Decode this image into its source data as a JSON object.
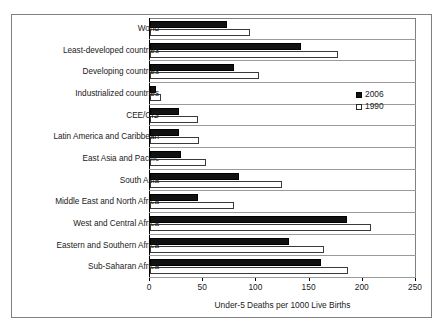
{
  "chart_data": {
    "type": "bar",
    "orientation": "horizontal",
    "title": "",
    "xlabel": "Under-5 Deaths per 1000 Live Births",
    "ylabel": "",
    "xlim": [
      0,
      250
    ],
    "xticks": [
      0,
      50,
      100,
      150,
      200,
      250
    ],
    "grid": true,
    "legend_position": "right-upper",
    "categories": [
      "World",
      "Least-developed countries",
      "Developing countries",
      "Industrialized countries",
      "CEE/CIS",
      "Latin America and Caribbean",
      "East Asia and Pacific",
      "South Asia",
      "Middle East and North Africa",
      "West and Central Africa",
      "Eastern and Southern Africa",
      "Sub-Saharan Africa"
    ],
    "series": [
      {
        "name": "2006",
        "color": "#111111",
        "style": "filled",
        "values": [
          72,
          142,
          79,
          6,
          27,
          27,
          29,
          84,
          45,
          185,
          131,
          161
        ]
      },
      {
        "name": "1990",
        "color": "#ffffff",
        "style": "hollow",
        "values": [
          94,
          177,
          102,
          10,
          45,
          46,
          53,
          124,
          79,
          208,
          164,
          186
        ]
      }
    ]
  },
  "legend": {
    "entries": [
      {
        "label": "2006",
        "swatch": "filled-square-black"
      },
      {
        "label": "1990",
        "swatch": "hollow-square-white"
      }
    ]
  }
}
